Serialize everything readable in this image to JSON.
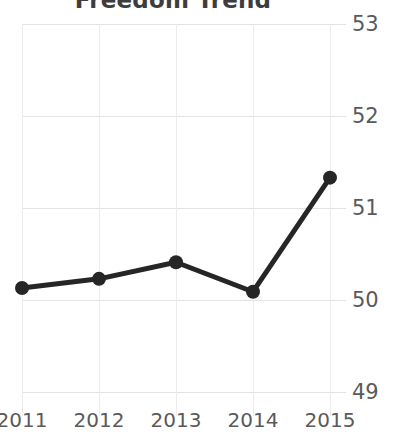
{
  "chart": {
    "title": "Freedom Trend",
    "accent_color": "#262626",
    "gridline_color": "#e2e2e2",
    "tick_label_color": "#5a5a5a",
    "background_color": "#ffffff"
  },
  "chart_data": {
    "type": "line",
    "title": "Freedom Trend",
    "xlabel": "",
    "ylabel": "",
    "categories": [
      "2011",
      "2012",
      "2013",
      "2014",
      "2015"
    ],
    "x": [
      2011,
      2012,
      2013,
      2014,
      2015
    ],
    "values": [
      50.13,
      50.23,
      50.41,
      50.09,
      51.33
    ],
    "series": [
      {
        "name": "Freedom",
        "values": [
          50.13,
          50.23,
          50.41,
          50.09,
          51.33
        ]
      }
    ],
    "ylim": [
      49,
      53
    ],
    "yticks": [
      49,
      50,
      51,
      52,
      53
    ],
    "ytick_labels": [
      "49",
      "50",
      "51",
      "52",
      "53"
    ],
    "xtick_labels": [
      "2011",
      "2012",
      "2013",
      "2014",
      "2015"
    ],
    "y_axis_position": "right",
    "grid": true,
    "grid_axis": "both",
    "legend": false,
    "legend_position": "none",
    "marker": "circle",
    "line_color": "#262626",
    "marker_color": "#262626",
    "line_width": 5
  }
}
